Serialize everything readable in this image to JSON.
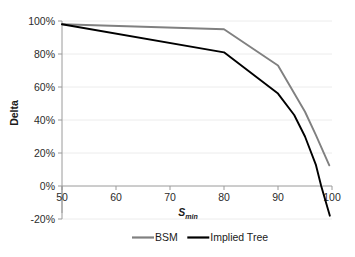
{
  "chart_data": {
    "type": "line",
    "title": "",
    "xlabel": "S",
    "xlabel_sub": "min",
    "ylabel": "Delta",
    "xlim": [
      50,
      100
    ],
    "ylim": [
      -20,
      100
    ],
    "xticks": [
      50,
      60,
      70,
      80,
      90,
      100
    ],
    "xtick_labels": [
      "50",
      "60",
      "70",
      "80",
      "90",
      "100"
    ],
    "yticks": [
      -20,
      0,
      20,
      40,
      60,
      80,
      100
    ],
    "ytick_labels": [
      "-20%",
      "0%",
      "20%",
      "40%",
      "60%",
      "80%",
      "100%"
    ],
    "grid": "horizontal-faint",
    "legend_position": "bottom",
    "series": [
      {
        "name": "BSM",
        "color": "#808080",
        "x": [
          50,
          80,
          90,
          95,
          97,
          99.5
        ],
        "values": [
          98,
          95,
          73,
          45,
          31,
          12.5
        ]
      },
      {
        "name": "Implied Tree",
        "color": "#000000",
        "x": [
          50,
          80,
          90,
          93,
          95,
          97,
          98,
          99.6
        ],
        "values": [
          98,
          81,
          56,
          43,
          30,
          13,
          0,
          -18
        ]
      }
    ]
  },
  "axes": {
    "y_title": "Delta",
    "x_title_base": "S",
    "x_title_sub": "min"
  },
  "legend": {
    "items": [
      {
        "label": "BSM",
        "color": "#808080"
      },
      {
        "label": "Implied Tree",
        "color": "#000000"
      }
    ]
  },
  "colors": {
    "bsm": "#808080",
    "implied_tree": "#000000",
    "axis": "#9a9a9a",
    "gridline": "#ececec",
    "text": "#231f20"
  }
}
